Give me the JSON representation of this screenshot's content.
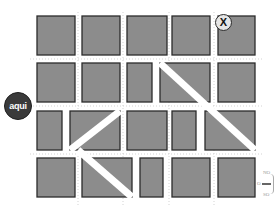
{
  "map": {
    "block_color": "#8c8c8c",
    "block_stroke": "#2b2b2b",
    "background": "#ffffff",
    "rows": [
      {
        "y": 16,
        "h": 39,
        "blocks": [
          {
            "x": 37,
            "w": 38
          },
          {
            "x": 82,
            "w": 38
          },
          {
            "x": 127,
            "w": 40
          },
          {
            "x": 172,
            "w": 38
          },
          {
            "x": 218,
            "w": 37
          }
        ]
      },
      {
        "y": 63,
        "h": 39,
        "blocks": [
          {
            "x": 37,
            "w": 38
          },
          {
            "x": 82,
            "w": 38
          },
          {
            "x": 127,
            "w": 25
          },
          {
            "x": 160,
            "w": 50,
            "diagonal": "\\"
          },
          {
            "x": 218,
            "w": 37
          }
        ]
      },
      {
        "y": 111,
        "h": 39,
        "blocks": [
          {
            "x": 37,
            "w": 25
          },
          {
            "x": 70,
            "w": 50,
            "diagonal": "/"
          },
          {
            "x": 127,
            "w": 40
          },
          {
            "x": 172,
            "w": 24
          },
          {
            "x": 205,
            "w": 50,
            "diagonal": "\\"
          }
        ]
      },
      {
        "y": 158,
        "h": 39,
        "blocks": [
          {
            "x": 37,
            "w": 38
          },
          {
            "x": 82,
            "w": 50,
            "diagonal": "\\"
          },
          {
            "x": 140,
            "w": 23
          },
          {
            "x": 172,
            "w": 38
          },
          {
            "x": 218,
            "w": 37
          }
        ]
      }
    ],
    "avenues": [
      {
        "name": "diagonal-avenue-nw-se-upper",
        "x1": 160,
        "y1": 63,
        "x2": 255,
        "y2": 150
      },
      {
        "name": "diagonal-avenue-sw-ne",
        "x1": 70,
        "y1": 150,
        "x2": 120,
        "y2": 111
      },
      {
        "name": "diagonal-avenue-nw-se-lower",
        "x1": 78,
        "y1": 150,
        "x2": 132,
        "y2": 197
      }
    ]
  },
  "markers": {
    "here": {
      "label": "aqui",
      "color": "#3a3a3a"
    },
    "destination": {
      "label": "X",
      "color": "#e6e6e6"
    }
  },
  "compass": {
    "north_west": "NO",
    "west": "O",
    "south_west": "SO"
  }
}
